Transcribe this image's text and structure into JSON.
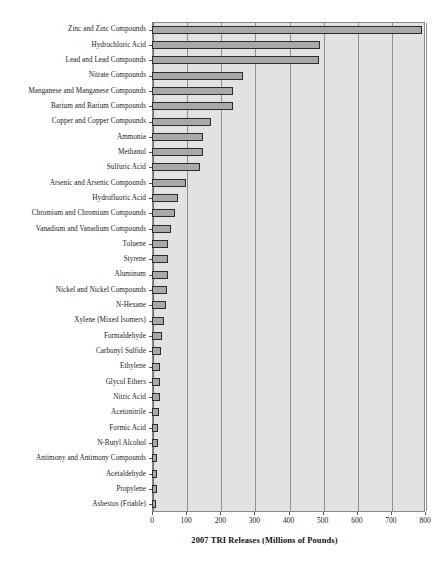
{
  "chart_data": {
    "type": "bar",
    "orientation": "horizontal",
    "title": "",
    "xlabel": "2007 TRI Releases (Millions of Pounds)",
    "ylabel": "",
    "xlim": [
      0,
      800
    ],
    "xticks": [
      0,
      100,
      200,
      300,
      400,
      500,
      600,
      700,
      800
    ],
    "xtick_labels": [
      "0",
      "100",
      "200",
      "300",
      "400",
      "500",
      "600",
      "700",
      "800"
    ],
    "grid": true,
    "legend": null,
    "categories": [
      "Zinc and Zinc Compounds",
      "Hydrochloric Acid",
      "Lead and Lead Compounds",
      "Nitrate Compounds",
      "Manganese and Manganese Compounds",
      "Barium and Barium Compounds",
      "Copper and Copper Compounds",
      "Ammonia",
      "Methanol",
      "Sulfuric Acid",
      "Arsenic and Arsenic Compounds",
      "Hydrofluoric Acid",
      "Chromium and Chromium Compounds",
      "Vanadium and Vanadium Compounds",
      "Toluene",
      "Styrene",
      "Aluminum",
      "Nickel and Nickel Compounds",
      "N-Hexane",
      "Xylene (Mixed Isomers)",
      "Formaldehyde",
      "Carbonyl Sulfide",
      "Ethylene",
      "Glycol Ethers",
      "Nitric Acid",
      "Acetonitrile",
      "Formic Acid",
      "N-Butyl Alcohol",
      "Antimony and Antimony Compounds",
      "Acetaldehyde",
      "Propylene",
      "Asbestos (Friable)"
    ],
    "values": [
      790,
      492,
      490,
      267,
      238,
      238,
      173,
      150,
      150,
      141,
      100,
      76,
      68,
      55,
      48,
      48,
      46,
      44,
      42,
      36,
      28,
      26,
      24,
      24,
      22,
      20,
      18,
      17,
      16,
      15,
      14,
      13
    ],
    "colors": {
      "bar_fill": "#a8a8a8",
      "bar_edge": "#2b2b2b",
      "plot_background": "#e2e2e2",
      "gridline": "#8f8f8f",
      "axis": "#555555",
      "text": "#1a1a1a",
      "page_background": "#ffffff"
    }
  }
}
